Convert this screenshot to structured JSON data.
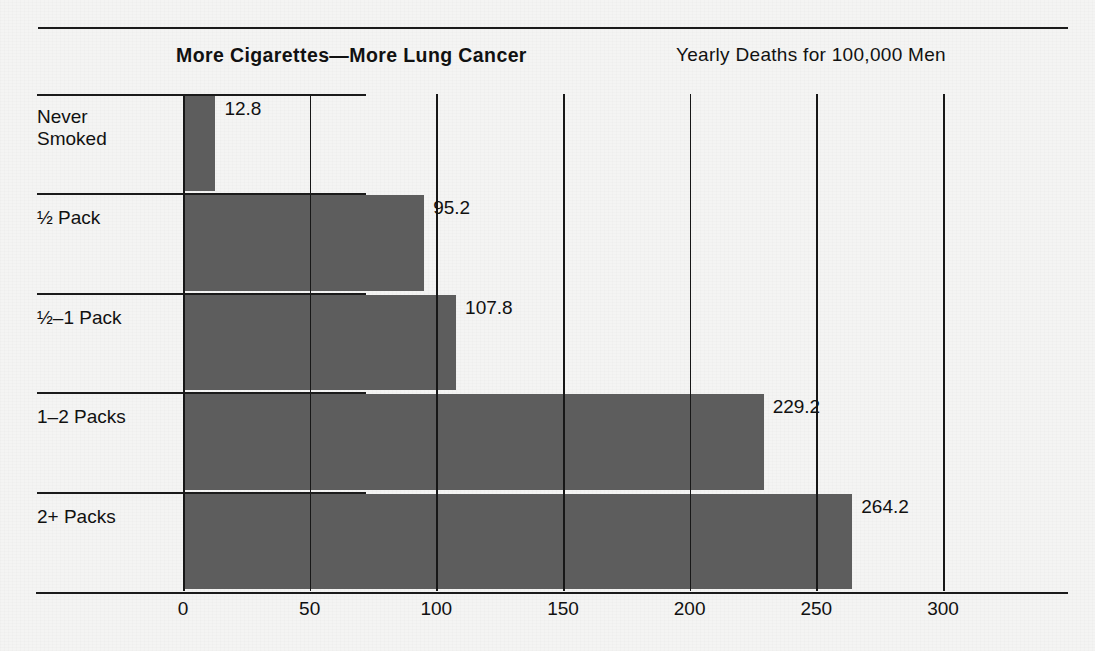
{
  "chart_data": {
    "type": "bar",
    "orientation": "horizontal",
    "title": "More Cigarettes—More Lung Cancer",
    "subtitle": "Yearly Deaths for 100,000 Men",
    "xlabel": "",
    "ylabel": "",
    "categories": [
      "Never\nSmoked",
      "½ Pack",
      "½–1 Pack",
      "1–2 Packs",
      "2+ Packs"
    ],
    "values": [
      12.8,
      95.2,
      107.8,
      229.2,
      264.2
    ],
    "value_labels": [
      "12.8",
      "95.2",
      "107.8",
      "229.2",
      "264.2"
    ],
    "xlim": [
      0,
      300
    ],
    "xticks": [
      0,
      50,
      100,
      150,
      200,
      250,
      300
    ],
    "xtick_labels": [
      "0",
      "50",
      "100",
      "150",
      "200",
      "250",
      "300"
    ],
    "grid": true,
    "legend": null,
    "bar_color": "#5d5d5d",
    "background_color": "#f4f4f3",
    "line_color": "#1b1b1b"
  }
}
